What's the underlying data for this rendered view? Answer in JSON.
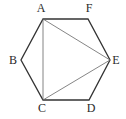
{
  "figure": {
    "type": "regular-hexagon-with-triangle",
    "colors": {
      "background": "#ffffff",
      "outline": "#333333",
      "diagonal": "#666666",
      "label": "#2a2a2a"
    },
    "vertices": [
      {
        "name": "A",
        "x": 43,
        "y": 19,
        "label_x": 41,
        "label_y": 12
      },
      {
        "name": "F",
        "x": 88,
        "y": 19,
        "label_x": 89,
        "label_y": 12
      },
      {
        "name": "E",
        "x": 110,
        "y": 60,
        "label_x": 116,
        "label_y": 64
      },
      {
        "name": "D",
        "x": 89,
        "y": 100,
        "label_x": 91,
        "label_y": 112
      },
      {
        "name": "C",
        "x": 43,
        "y": 100,
        "label_x": 42,
        "label_y": 112
      },
      {
        "name": "B",
        "x": 21,
        "y": 60,
        "label_x": 13,
        "label_y": 64
      }
    ],
    "hexagon": [
      "A",
      "F",
      "E",
      "D",
      "C",
      "B"
    ],
    "diagonals": [
      [
        "A",
        "C"
      ],
      [
        "A",
        "E"
      ],
      [
        "C",
        "E"
      ]
    ],
    "labels": {
      "A": "A",
      "B": "B",
      "C": "C",
      "D": "D",
      "E": "E",
      "F": "F"
    }
  }
}
